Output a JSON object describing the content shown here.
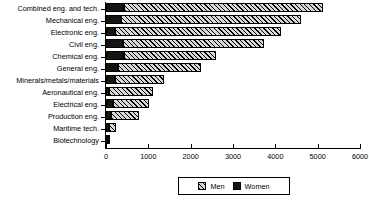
{
  "chart_data": {
    "type": "bar",
    "orientation": "horizontal",
    "stacked": true,
    "title": "",
    "xlabel": "",
    "ylabel": "",
    "xlim": [
      0,
      6000
    ],
    "xticks": [
      0,
      1000,
      2000,
      3000,
      4000,
      5000,
      6000
    ],
    "xticklabels": [
      "0",
      "1000",
      "2000",
      "3000",
      "4000",
      "5000",
      "6000"
    ],
    "grid": false,
    "legend_position": "bottom-center",
    "categories": [
      "Combined eng. and tech.",
      "Mechanical eng.",
      "Electronic eng.",
      "Civil eng.",
      "Chemical eng.",
      "General eng.",
      "Minerals/metals/materials",
      "Aeronautical eng.",
      "Electrical eng.",
      "Production eng.",
      "Maritime tech.",
      "Biotechnology"
    ],
    "series": [
      {
        "name": "Women",
        "color": "#141414",
        "pattern": "solid",
        "values": [
          430,
          355,
          210,
          400,
          430,
          280,
          210,
          70,
          165,
          120,
          60,
          40
        ]
      },
      {
        "name": "Men",
        "color": "#d8d8d8",
        "pattern": "diagonal-hatch",
        "values": [
          4690,
          4255,
          3925,
          3335,
          2170,
          1960,
          1160,
          1035,
          845,
          655,
          175,
          55
        ]
      }
    ],
    "totals": [
      5120,
      4610,
      4135,
      3735,
      2600,
      2240,
      1370,
      1105,
      1010,
      775,
      235,
      95
    ]
  },
  "legend": {
    "items": [
      {
        "label": "Men"
      },
      {
        "label": "Women"
      }
    ]
  }
}
